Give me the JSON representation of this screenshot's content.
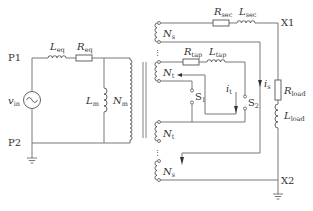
{
  "diagram": {
    "primary": {
      "node_top": "P1",
      "node_bottom": "P2",
      "source": {
        "symbol": "v",
        "sub": "in"
      },
      "series_inductor": {
        "symbol": "L",
        "sub": "eq"
      },
      "series_resistor": {
        "symbol": "R",
        "sub": "eq"
      },
      "magnetizing_inductor": {
        "symbol": "L",
        "sub": "m"
      },
      "primary_winding": {
        "symbol": "N",
        "sub": "m"
      }
    },
    "secondary": {
      "windings": [
        {
          "symbol": "N",
          "sub": "s"
        },
        {
          "symbol": "N",
          "sub": "t"
        },
        {
          "symbol": "N",
          "sub": "t"
        },
        {
          "symbol": "N",
          "sub": "s"
        }
      ],
      "secondary_resistor": {
        "symbol": "R",
        "sub": "sec"
      },
      "secondary_inductor": {
        "symbol": "L",
        "sub": "sec"
      },
      "tap_resistor": {
        "symbol": "R",
        "sub": "tap"
      },
      "tap_inductor": {
        "symbol": "L",
        "sub": "tap"
      },
      "switches": [
        {
          "symbol": "S",
          "sub": "1"
        },
        {
          "symbol": "S",
          "sub": "2"
        }
      ],
      "currents": [
        {
          "symbol": "i",
          "sub": "t"
        },
        {
          "symbol": "i",
          "sub": "s"
        }
      ]
    },
    "load": {
      "node_top": "X1",
      "node_bottom": "X2",
      "resistor": {
        "symbol": "R",
        "sub": "load"
      },
      "inductor": {
        "symbol": "L",
        "sub": "load"
      }
    },
    "caption": "",
    "colors": {
      "line": "#6a6a6a",
      "text": "#333333",
      "background": "#ffffff"
    }
  }
}
